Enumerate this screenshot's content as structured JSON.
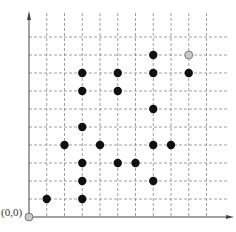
{
  "diagram": {
    "origin_label": "(0,0)",
    "grid": {
      "cols": 10,
      "rows": 10,
      "x0": 29,
      "y0": 217,
      "dx": 17.75,
      "dy": 18
    },
    "colors": {
      "black_point": "#111111",
      "gray_point": "#c8c8c8",
      "grid": "#888888",
      "axis": "#444444"
    },
    "black_points": [
      [
        1,
        1
      ],
      [
        3,
        1
      ],
      [
        3,
        2
      ],
      [
        7,
        2
      ],
      [
        3,
        3
      ],
      [
        5,
        3
      ],
      [
        6,
        3
      ],
      [
        2,
        4
      ],
      [
        4,
        4
      ],
      [
        7,
        4
      ],
      [
        8,
        4
      ],
      [
        3,
        5
      ],
      [
        7,
        6
      ],
      [
        3,
        7
      ],
      [
        5,
        7
      ],
      [
        3,
        8
      ],
      [
        5,
        8
      ],
      [
        7,
        8
      ],
      [
        9,
        8
      ],
      [
        7,
        9
      ]
    ],
    "gray_points": [
      [
        0,
        0
      ],
      [
        9,
        9
      ]
    ]
  }
}
